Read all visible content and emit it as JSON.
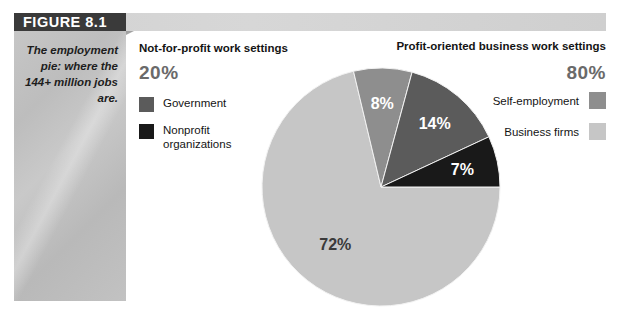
{
  "figure": {
    "tab_label": "FIGURE 8.1",
    "caption": "The employment pie: where the 144+ million jobs are."
  },
  "left_column": {
    "heading": "Not-for-profit work settings",
    "total_percent": "20%",
    "legend": [
      {
        "label": "Government",
        "color": "#5b5b5b"
      },
      {
        "label": "Nonprofit organizations",
        "color": "#191919"
      }
    ]
  },
  "right_column": {
    "heading": "Profit-oriented business work settings",
    "total_percent": "80%",
    "legend": [
      {
        "label": "Self-employment",
        "color": "#8e8e8e"
      },
      {
        "label": "Business firms",
        "color": "#c6c6c6"
      }
    ]
  },
  "chart_data": {
    "type": "pie",
    "title": "The employment pie: where the 144+ million jobs are.",
    "categories": [
      "Business firms",
      "Self-employment",
      "Government",
      "Nonprofit organizations"
    ],
    "values": [
      72,
      8,
      14,
      7
    ],
    "labels": [
      "72%",
      "8%",
      "14%",
      "7%"
    ],
    "colors": [
      "#c6c6c6",
      "#8e8e8e",
      "#5b5b5b",
      "#191919"
    ],
    "label_text_colors": [
      "#3a3a3a",
      "#ffffff",
      "#ffffff",
      "#ffffff"
    ],
    "start_angle_deg": 0,
    "direction": "clockwise",
    "groups": [
      {
        "name": "Profit-oriented business work settings",
        "total": 80,
        "members": [
          "Business firms",
          "Self-employment"
        ]
      },
      {
        "name": "Not-for-profit work settings",
        "total": 20,
        "members": [
          "Government",
          "Nonprofit organizations"
        ]
      }
    ],
    "legend": "split-sides",
    "grid": false,
    "xlabel": "",
    "ylabel": ""
  }
}
